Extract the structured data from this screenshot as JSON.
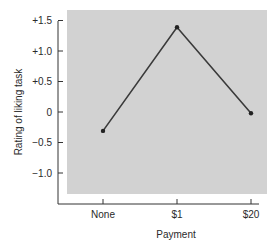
{
  "chart_data": {
    "type": "line",
    "title": "",
    "xlabel": "Payment",
    "ylabel": "Rating of liking task",
    "categories": [
      "None",
      "$1",
      "$20"
    ],
    "series": [
      {
        "name": "Rating",
        "values": [
          -0.31,
          1.39,
          -0.02
        ]
      }
    ],
    "yticks": [
      1.5,
      1.0,
      0.5,
      0,
      -0.5,
      -1.0
    ],
    "ytick_labels": [
      "+1.5",
      "+1.0",
      "+0.5",
      "0",
      "−0.5",
      "−1.0"
    ],
    "ylim": [
      -1.35,
      1.65
    ],
    "grid": false,
    "legend": null,
    "colors": {
      "plot_background": "#d2d2d2",
      "line": "#3a3a3a",
      "axis": "#333333"
    }
  }
}
